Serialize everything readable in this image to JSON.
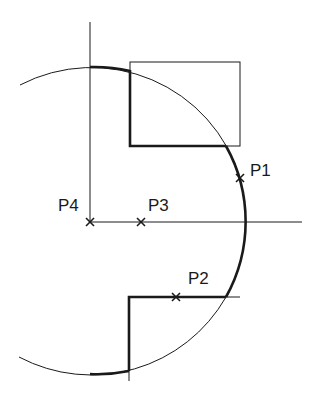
{
  "diagram": {
    "type": "geometric-construction",
    "colors": {
      "stroke": "#1a1a1a",
      "background": "#ffffff"
    },
    "circle": {
      "cx": 92,
      "cy": 221,
      "r": 155
    },
    "points": [
      {
        "id": "P1",
        "label": "P1",
        "x": 240,
        "y": 178
      },
      {
        "id": "P2",
        "label": "P2",
        "x": 176,
        "y": 297
      },
      {
        "id": "P3",
        "label": "P3",
        "x": 141,
        "y": 222
      },
      {
        "id": "P4",
        "label": "P4",
        "x": 90,
        "y": 222
      }
    ],
    "rectangle": {
      "x": 130,
      "y": 62,
      "width": 110,
      "height": 84
    }
  }
}
